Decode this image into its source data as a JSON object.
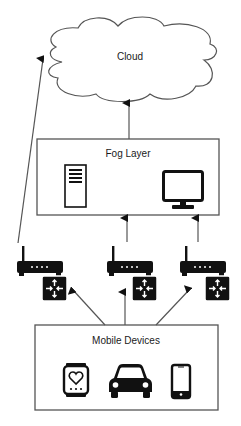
{
  "diagram": {
    "type": "fog-computing-architecture",
    "nodes": {
      "cloud": {
        "label": "Cloud"
      },
      "fog_layer": {
        "label": "Fog Layer",
        "icons": [
          "server-tower-icon",
          "monitor-icon"
        ]
      },
      "gateways": [
        {
          "id": "gateway-left",
          "icons": [
            "wireless-router-icon",
            "network-switch-icon"
          ]
        },
        {
          "id": "gateway-middle",
          "icons": [
            "wireless-router-icon",
            "network-switch-icon"
          ]
        },
        {
          "id": "gateway-right",
          "icons": [
            "wireless-router-icon",
            "network-switch-icon"
          ]
        }
      ],
      "mobile_devices": {
        "label": "Mobile Devices",
        "icons": [
          "smartwatch-heart-icon",
          "car-icon",
          "smartphone-icon"
        ]
      }
    },
    "edges": [
      {
        "from": "fog_layer",
        "to": "cloud"
      },
      {
        "from": "gateway-left",
        "to": "cloud"
      },
      {
        "from": "gateway-middle",
        "to": "fog_layer"
      },
      {
        "from": "gateway-right",
        "to": "fog_layer"
      },
      {
        "from": "mobile_devices",
        "to": "gateway-left"
      },
      {
        "from": "mobile_devices",
        "to": "gateway-middle"
      },
      {
        "from": "mobile_devices",
        "to": "gateway-right"
      }
    ],
    "colors": {
      "stroke": "#555555",
      "icon": "#111111",
      "background": "#ffffff"
    }
  }
}
